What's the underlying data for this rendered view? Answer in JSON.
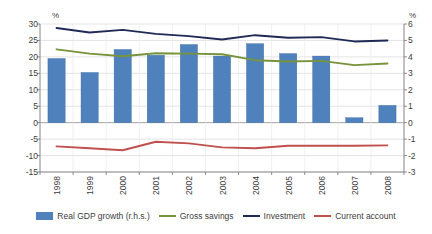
{
  "chart_data": {
    "type": "bar",
    "title": "",
    "subtitle": "",
    "xlabel": "",
    "ylabel": "%",
    "y2label": "%",
    "categories": [
      "1998",
      "1999",
      "2000",
      "2001",
      "2002",
      "2003",
      "2004",
      "2005",
      "2006",
      "2007",
      "2008"
    ],
    "ylim": [
      -15,
      30
    ],
    "y2lim": [
      -3,
      6
    ],
    "yticks": [
      "30",
      "25",
      "20",
      "15",
      "10",
      "5",
      "0",
      "-5",
      "-10",
      "-15"
    ],
    "y2ticks": [
      "6",
      "5",
      "4",
      "3",
      "2",
      "1",
      "0",
      "-1",
      "-2",
      "-3"
    ],
    "grid": true,
    "legend_position": "bottom",
    "series": [
      {
        "name": "Real GDP growth (r.h.s.)",
        "type": "bar",
        "axis": "right",
        "color": "#4f81bd",
        "values": [
          3.9,
          3.05,
          4.45,
          4.1,
          4.75,
          4.05,
          4.8,
          4.2,
          4.05,
          0.3,
          1.05
        ]
      },
      {
        "name": "Gross savings",
        "type": "line",
        "axis": "left",
        "color": "#77933c",
        "values": [
          22.3,
          21.0,
          20.2,
          21.1,
          21.0,
          20.8,
          19.0,
          18.6,
          18.8,
          17.5,
          18.0
        ]
      },
      {
        "name": "Investment",
        "type": "line",
        "axis": "left",
        "color": "#1f2a55",
        "values": [
          28.8,
          27.4,
          28.2,
          27.0,
          26.3,
          25.3,
          26.6,
          25.8,
          26.0,
          24.7,
          25.0
        ]
      },
      {
        "name": "Current account",
        "type": "line",
        "axis": "left",
        "color": "#c0504d",
        "values": [
          -7.2,
          -7.8,
          -8.4,
          -5.8,
          -6.3,
          -7.5,
          -7.8,
          -7.0,
          -7.0,
          -7.0,
          -6.9
        ]
      }
    ]
  },
  "legend": {
    "items": [
      {
        "label": "Real GDP growth (r.h.s.)",
        "marker": "bar",
        "color": "#4f81bd"
      },
      {
        "label": "Gross savings",
        "marker": "line",
        "color": "#77933c"
      },
      {
        "label": "Investment",
        "marker": "line",
        "color": "#1f2a55"
      },
      {
        "label": "Current account",
        "marker": "line",
        "color": "#c0504d"
      }
    ]
  },
  "axes": {
    "left_unit": "%",
    "right_unit": "%"
  }
}
